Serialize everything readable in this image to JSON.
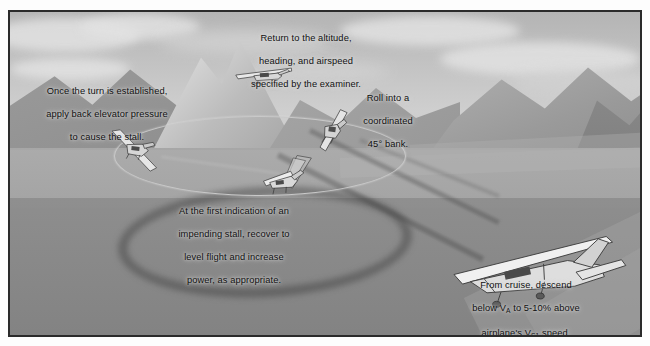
{
  "figure": {
    "style": "grayscale technical illustration",
    "frame_color": "#2b2b2b",
    "text_color": "#111111",
    "sky_color": "#c2c2c2",
    "ground_color": "#9e9e9e",
    "shadow_color": "#303030"
  },
  "captions": {
    "establish_turn": {
      "line1": "Once the turn is established,",
      "line2": "apply back elevator pressure",
      "line3": "to cause the stall."
    },
    "return_to_altitude": {
      "line1": "Return to the altitude,",
      "line2": "heading, and airspeed",
      "line3": "specified by the examiner."
    },
    "roll_into_bank": {
      "line1": "Roll into a",
      "line2": "coordinated",
      "line3": "45° bank."
    },
    "recover_stall": {
      "line1": "At the first indication of an",
      "line2": "impending stall, recover to",
      "line3": "level flight and increase",
      "line4": "power, as appropriate."
    },
    "descend_from_cruise": {
      "line1": "From cruise, descend",
      "line2_pre": "below V",
      "line2_sub": "A",
      "line2_post": " to 5-10% above",
      "line3_pre": "airplane's V",
      "line3_sub": "S1",
      "line3_post": " speed."
    }
  },
  "aircraft": [
    {
      "name": "aircraft-descending-cruise",
      "label": "large airplane descending from cruise"
    },
    {
      "name": "aircraft-roll-into-bank",
      "label": "airplane rolling into 45 degree bank"
    },
    {
      "name": "aircraft-at-stall",
      "label": "airplane at impending stall"
    },
    {
      "name": "aircraft-turn-established",
      "label": "airplane with turn established"
    },
    {
      "name": "aircraft-recovered",
      "label": "airplane returned to altitude and heading"
    }
  ],
  "scene_elements": {
    "turn_circle": "flight path circle",
    "ground_shadow": "shadow of turn circle on ground",
    "mountains": "mountain range backdrop",
    "clouds": "cloud layer"
  }
}
